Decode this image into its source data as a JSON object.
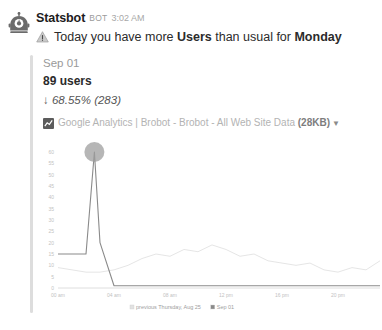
{
  "message": {
    "avatar_icon": "robot-avatar-icon",
    "author": "Statsbot",
    "bot_badge": "BOT",
    "timestamp": "3:02 AM",
    "alert_icon": "warning-triangle-icon",
    "alert_prefix": "Today you have more ",
    "alert_metric": "Users",
    "alert_middle": " than usual for ",
    "alert_day": "Monday"
  },
  "attachment": {
    "date": "Sep 01",
    "value": "89 users",
    "delta_arrow": "↓",
    "delta": " 68.55% (283)",
    "source_icon": "google-analytics-icon",
    "source": "Google Analytics | Brobot - Brobot - All Web Site Data ",
    "size": "(28KB)",
    "caret_icon": "chevron-down-icon"
  },
  "chart_data": {
    "type": "line",
    "title": "",
    "xlabel": "",
    "ylabel": "",
    "ylim": [
      0,
      60
    ],
    "yticks": [
      0,
      5,
      10,
      15,
      20,
      25,
      30,
      35,
      40,
      45,
      50,
      55,
      60
    ],
    "xticks": [
      "00 am",
      "04 am",
      "08 am",
      "12 pm",
      "16 pm",
      "20 pm"
    ],
    "xtick_hours": [
      0,
      4,
      8,
      12,
      16,
      20
    ],
    "grid": false,
    "legend_position": "bottom",
    "marker": {
      "hour": 2.6,
      "value": 60,
      "color": "#9e9e9e",
      "radius": 10
    },
    "series": [
      {
        "name": "previous Thursday, Aug 25",
        "color": "#e2e2e2",
        "x": [
          0,
          1,
          2,
          3,
          4,
          5,
          6,
          7,
          8,
          9,
          10,
          11,
          12,
          13,
          14,
          15,
          16,
          17,
          18,
          19,
          20,
          21,
          22,
          23
        ],
        "values": [
          9,
          8,
          7,
          7,
          8,
          10,
          13,
          15,
          14,
          17,
          16,
          19,
          17,
          14,
          15,
          12,
          11,
          10,
          11,
          8,
          7,
          9,
          8,
          12
        ]
      },
      {
        "name": "Sep 01",
        "color": "#8a8a8a",
        "x": [
          0,
          1,
          2,
          2.6,
          3,
          4,
          5,
          6,
          7,
          8,
          9,
          10,
          11,
          12,
          13,
          14,
          15,
          16,
          17,
          18,
          19,
          20,
          21,
          22,
          23
        ],
        "values": [
          15,
          15,
          15,
          60,
          20,
          1,
          1,
          1,
          1,
          1,
          1,
          1,
          1,
          1,
          1,
          1,
          1,
          1,
          1,
          1,
          1,
          1,
          1,
          1,
          1
        ]
      }
    ]
  }
}
